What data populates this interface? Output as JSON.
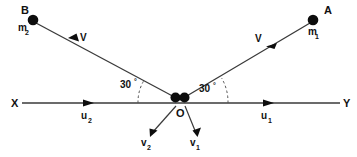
{
  "diagram": {
    "background_color": "#ffffff",
    "line_color": "#3a3a3a",
    "dot_color": "#0d0d0d",
    "axis": {
      "left_label": "X",
      "right_label": "Y"
    },
    "origin": {
      "label": "O",
      "mass_count": 2
    },
    "bodies": [
      {
        "point_label": "A",
        "mass_label": "m",
        "mass_subscript": "1",
        "velocity_label": "V",
        "side": "right"
      },
      {
        "point_label": "B",
        "mass_label": "m",
        "mass_subscript": "2",
        "velocity_label": "V",
        "side": "left"
      }
    ],
    "angles": [
      {
        "value": "30",
        "unit": "°",
        "side": "left"
      },
      {
        "value": "30",
        "unit": "°",
        "side": "right"
      }
    ],
    "axis_vectors": [
      {
        "label": "u",
        "subscript": "2",
        "side": "left",
        "direction": "right"
      },
      {
        "label": "u",
        "subscript": "1",
        "side": "right",
        "direction": "right"
      }
    ],
    "outgoing_vectors": [
      {
        "label": "v",
        "subscript": "2",
        "side": "left",
        "direction": "down-left"
      },
      {
        "label": "v",
        "subscript": "1",
        "side": "right",
        "direction": "down-right"
      }
    ]
  }
}
